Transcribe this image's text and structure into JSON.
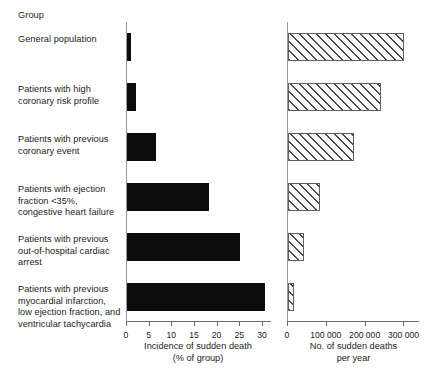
{
  "header": {
    "group_column": "Group"
  },
  "chart_data": {
    "type": "bar",
    "title": "",
    "orientation": "horizontal",
    "grid": false,
    "legend": null,
    "categories": [
      "General population",
      "Patients with high coronary risk profile",
      "Patients with previous coronary event",
      "Patients with ejection fraction <35%, congestive heart failure",
      "Patients with previous out-of-hospital cardiac arrest",
      "Patients with previous myocardial infarction, low ejection fraction, and ventricular tachycardia"
    ],
    "category_lines": [
      [
        "General population"
      ],
      [
        "Patients with high",
        "coronary risk profile"
      ],
      [
        "Patients with previous",
        "coronary event"
      ],
      [
        "Patients with ejection",
        "fraction <35%,",
        "congestive heart failure"
      ],
      [
        "Patients with previous",
        "out-of-hospital cardiac",
        "arrest"
      ],
      [
        "Patients with previous",
        "myocardial infarction,",
        "low ejection fraction, and",
        "ventricular tachycardia"
      ]
    ],
    "panels": [
      {
        "id": "incidence",
        "xlabel_lines": [
          "Incidence of sudden death",
          "(% of group)"
        ],
        "xlabel": "Incidence of sudden death (% of group)",
        "unit": "%",
        "xlim": [
          0,
          32
        ],
        "ticks": [
          0,
          5,
          10,
          15,
          20,
          25,
          30
        ],
        "tick_labels": [
          "0",
          "5",
          "10",
          "15",
          "20",
          "25",
          "30"
        ],
        "fill": "solid",
        "values": [
          0.9,
          2.0,
          6.3,
          18.0,
          25.0,
          30.5
        ]
      },
      {
        "id": "deaths",
        "xlabel_lines": [
          "No. of sudden deaths",
          "per year"
        ],
        "xlabel": "No. of sudden deaths per year",
        "unit": "deaths/year",
        "xlim": [
          0,
          340000
        ],
        "ticks": [
          0,
          100000,
          200000,
          300000
        ],
        "tick_labels": [
          "0",
          "100 000",
          "200 000",
          "300 000"
        ],
        "fill": "hatched",
        "values": [
          300000,
          240000,
          170000,
          82000,
          42000,
          16000
        ]
      }
    ]
  },
  "colors": {
    "solid_bar": "#0c0c0c",
    "hatch_line": "#4a4a4a",
    "hatch_fill": "#fbfbfb",
    "axis": "#6e6e6e",
    "text": "#1b1b1b"
  }
}
